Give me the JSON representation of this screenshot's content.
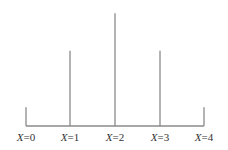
{
  "chart_data": {
    "type": "bar",
    "title": "",
    "xlabel": "",
    "ylabel": "",
    "categories": [
      "X=0",
      "X=1",
      "X=2",
      "X=3",
      "X=4"
    ],
    "values": [
      1,
      4,
      6,
      4,
      1
    ],
    "note": "Relative heights of vertical lines (probability-mass style plot, proportional 1:4:6:4:1)",
    "grid": false,
    "legend": null,
    "colors": {
      "line": "#8a8a8a",
      "text": "#333333"
    }
  }
}
